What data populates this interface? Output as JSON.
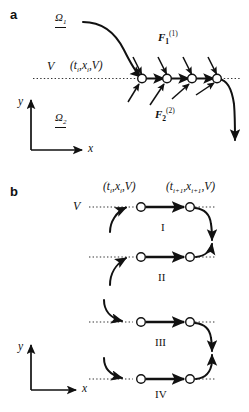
{
  "figure": {
    "panels": [
      {
        "id": "a",
        "letter": "a",
        "labels": {
          "omega1": "Ω",
          "omega1_sub": "1",
          "omega2": "Ω",
          "omega2_sub": "2",
          "force1": "F",
          "force1_sub": "1",
          "force1_sup": "(1)",
          "force2": "F",
          "force2_sub": "2",
          "force2_sup": "(2)",
          "v_label": "V",
          "state_tuple_open": "(",
          "state_t": "t",
          "state_t_sub": "i",
          "state_comma1": ",",
          "state_x": "x",
          "state_x_sub": "i",
          "state_comma2": ",",
          "state_v": "V",
          "state_tuple_close": ")",
          "axis_x": "x",
          "axis_y": "y"
        }
      },
      {
        "id": "b",
        "letter": "b",
        "labels": {
          "v_label": "V",
          "axis_x": "x",
          "axis_y": "y",
          "tuple_i_open": "(",
          "tuple_i_t": "t",
          "tuple_i_t_sub": "i",
          "tuple_i_x": "x",
          "tuple_i_x_sub": "i",
          "tuple_i_v": "V",
          "tuple_i_close": ")",
          "tuple_i1_open": "(",
          "tuple_i1_t": "t",
          "tuple_i1_t_sub": "i+1",
          "tuple_i1_x": "x",
          "tuple_i1_x_sub": "i+1",
          "tuple_i1_v": "V",
          "tuple_i1_close": ")"
        },
        "rows": [
          {
            "numeral": "I"
          },
          {
            "numeral": "II"
          },
          {
            "numeral": "III"
          },
          {
            "numeral": "IV"
          }
        ]
      }
    ],
    "colors": {
      "stroke": "#111111",
      "dotted": "#333333",
      "node_fill": "#ffffff",
      "background": "#ffffff"
    }
  }
}
